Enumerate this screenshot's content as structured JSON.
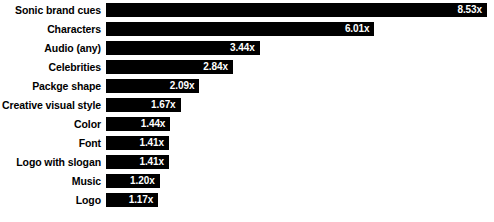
{
  "chart_data": {
    "type": "bar",
    "orientation": "horizontal",
    "title": "",
    "subtitle": "",
    "xlabel": "",
    "ylabel": "",
    "grid": false,
    "legend": null,
    "xlim": [
      0,
      8.53
    ],
    "value_suffix": "x",
    "bar_color": "#000000",
    "value_label_color": "#ffffff",
    "category_label_color": "#000000",
    "background_color": "#ffffff",
    "categories": [
      "Sonic brand cues",
      "Characters",
      "Audio (any)",
      "Celebrities",
      "Packge shape",
      "Creative visual style",
      "Color",
      "Font",
      "Logo with slogan",
      "Music",
      "Logo",
      "Visual (any)"
    ],
    "values": [
      8.53,
      6.01,
      3.44,
      2.84,
      2.09,
      1.67,
      1.44,
      1.41,
      1.41,
      1.2,
      1.17,
      1.15
    ],
    "bars": [
      {
        "label": "Sonic brand cues",
        "value": 8.53,
        "value_text": "8.53x"
      },
      {
        "label": "Characters",
        "value": 6.01,
        "value_text": "6.01x"
      },
      {
        "label": "Audio (any)",
        "value": 3.44,
        "value_text": "3.44x"
      },
      {
        "label": "Celebrities",
        "value": 2.84,
        "value_text": "2.84x"
      },
      {
        "label": "Packge shape",
        "value": 2.09,
        "value_text": "2.09x"
      },
      {
        "label": "Creative visual style",
        "value": 1.67,
        "value_text": "1.67x"
      },
      {
        "label": "Color",
        "value": 1.44,
        "value_text": "1.44x"
      },
      {
        "label": "Font",
        "value": 1.41,
        "value_text": "1.41x"
      },
      {
        "label": "Logo with slogan",
        "value": 1.41,
        "value_text": "1.41x"
      },
      {
        "label": "Music",
        "value": 1.2,
        "value_text": "1.20x"
      },
      {
        "label": "Logo",
        "value": 1.17,
        "value_text": "1.17x"
      },
      {
        "label": "Visual (any)",
        "value": 1.15,
        "value_text": "1.15x"
      }
    ]
  }
}
